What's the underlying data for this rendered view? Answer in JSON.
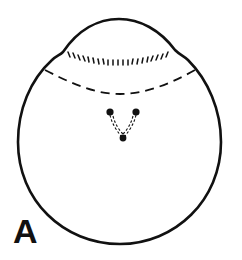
{
  "figure": {
    "panel_label": "A",
    "colors": {
      "stroke": "#111111",
      "background": "#ffffff"
    },
    "elements": [
      {
        "name": "cell-outline",
        "type": "solid-outline"
      },
      {
        "name": "apical-dome-striations",
        "type": "short-hatch-marks"
      },
      {
        "name": "dashed-boundary-line",
        "type": "dashed-curve"
      },
      {
        "name": "dots",
        "count": 3
      },
      {
        "name": "dashed-v-connectors",
        "type": "dashed-lines"
      }
    ]
  }
}
